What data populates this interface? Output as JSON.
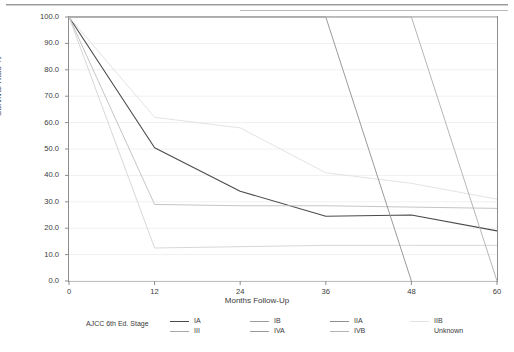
{
  "chart_data": {
    "type": "line",
    "title": "",
    "xlabel": "Months Follow-Up",
    "ylabel": "Survival Rate %",
    "xlim": [
      0,
      60
    ],
    "ylim": [
      0,
      100
    ],
    "xticks": [
      "0",
      "12",
      "24",
      "36",
      "48",
      "60"
    ],
    "yticks": [
      "0.0",
      "10.0",
      "20.0",
      "30.0",
      "40.0",
      "50.0",
      "60.0",
      "70.0",
      "80.0",
      "90.0",
      "100.0"
    ],
    "grid": true,
    "legend_position": "bottom",
    "legend_title": "AJCC 6th Ed. Stage",
    "x": [
      0,
      12,
      24,
      36,
      48,
      60
    ],
    "series": [
      {
        "name": "IA",
        "color": "#4a4a4a",
        "values": [
          100.0,
          50.5,
          34.0,
          24.5,
          25.0,
          19.0
        ]
      },
      {
        "name": "IB",
        "color": "#b9b9b9",
        "values": [
          100.0,
          100.0,
          100.0,
          100.0,
          100.0,
          100.0
        ]
      },
      {
        "name": "IIA",
        "color": "#c9c9c9",
        "values": [
          100.0,
          100.0,
          100.0,
          100.0,
          100.0,
          100.0
        ]
      },
      {
        "name": "IIB",
        "color": "#e0e0e0",
        "values": [
          100.0,
          62.0,
          58.0,
          41.0,
          37.0,
          31.0
        ]
      },
      {
        "name": "III",
        "color": "#bdbdbd",
        "values": [
          100.0,
          29.0,
          28.5,
          28.5,
          28.0,
          27.5
        ]
      },
      {
        "name": "IVA",
        "color": "#d2d2d2",
        "values": [
          100.0,
          12.5,
          13.0,
          13.5,
          13.5,
          13.5
        ]
      },
      {
        "name": "IVB",
        "color": "#8f8f8f",
        "values": [
          100.0,
          100.0,
          100.0,
          100.0,
          0.0,
          null
        ]
      },
      {
        "name": "Unknown",
        "color": "#aeaeae",
        "values": [
          100.0,
          100.0,
          100.0,
          100.0,
          100.0,
          0.0
        ]
      }
    ]
  },
  "legend": {
    "title": "AJCC 6th Ed. Stage",
    "row1": [
      {
        "label": "IA",
        "color": "#4a4a4a",
        "has_swatch": true
      },
      {
        "label": "IB",
        "color": "#9d9d9d",
        "has_swatch": true
      },
      {
        "label": "IIA",
        "color": "#8f8f8f",
        "has_swatch": true
      },
      {
        "label": "IIB",
        "color": "#e2e2e2",
        "has_swatch": true
      }
    ],
    "row2": [
      {
        "label": "III",
        "color": "#a8a8a8",
        "has_swatch": true
      },
      {
        "label": "IVA",
        "color": "#9a9a9a",
        "has_swatch": true
      },
      {
        "label": "IVB",
        "color": "#b4b4b4",
        "has_swatch": true
      },
      {
        "label": "Unknown",
        "color": "#e6e6e6",
        "has_swatch": false
      }
    ]
  },
  "axes": {
    "y_title": "Survival Rate %",
    "x_title": "Months Follow-Up"
  }
}
